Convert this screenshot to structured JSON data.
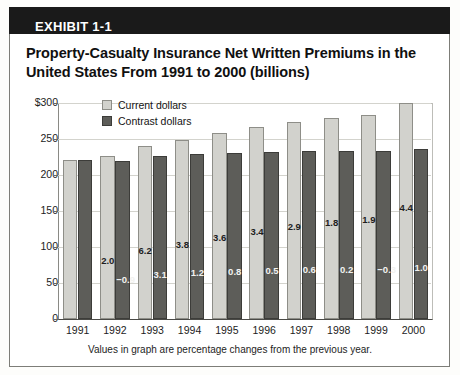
{
  "exhibit": {
    "label": "EXHIBIT 1-1",
    "title": "Property-Casualty Insurance Net Written Premiums in the United States From 1991 to 2000 (billions)"
  },
  "chart_data": {
    "type": "bar",
    "title": "Property-Casualty Insurance Net Written Premiums in the United States From 1991 to 2000 (billions)",
    "xlabel": "",
    "ylabel": "",
    "ylim": [
      0,
      300
    ],
    "yticks": [
      "$300",
      "250",
      "200",
      "150",
      "100",
      "50",
      "0"
    ],
    "ytick_values": [
      300,
      250,
      200,
      150,
      100,
      50,
      0
    ],
    "grid": true,
    "legend_position": "top-left-inside",
    "categories": [
      "1991",
      "1992",
      "1993",
      "1994",
      "1995",
      "1996",
      "1997",
      "1998",
      "1999",
      "2000"
    ],
    "series": [
      {
        "name": "Current dollars",
        "color": "#d2d2cd",
        "values": [
          221,
          226,
          240,
          249,
          258,
          266,
          274,
          279,
          284,
          300
        ],
        "labels": [
          "",
          "2.0",
          "6.2",
          "3.8",
          "3.6",
          "3.4",
          "2.9",
          "1.8",
          "1.9",
          "4.4"
        ]
      },
      {
        "name": "Contrast dollars",
        "color": "#5d5d59",
        "values": [
          221,
          219,
          226,
          229,
          231,
          232,
          233,
          234,
          233,
          236
        ],
        "labels": [
          "",
          "−0.9",
          "3.1",
          "1.2",
          "0.8",
          "0.5",
          "0.6",
          "0.2",
          "−0.3",
          "1.0"
        ]
      }
    ],
    "annotation": "Values in graph are percentage changes from the previous year."
  }
}
